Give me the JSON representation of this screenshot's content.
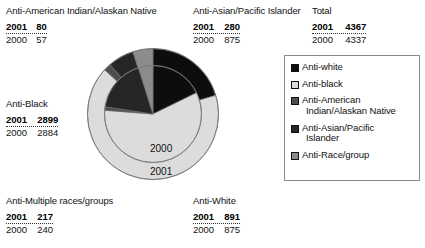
{
  "callouts": {
    "amerindian": {
      "title": "Anti-American Indian/Alaskan Native",
      "y2001_label": "2001",
      "y2001_value": "80",
      "y2000_label": "2000",
      "y2000_value": "57"
    },
    "asian": {
      "title": "Anti-Asian/Pacific Islander",
      "y2001_label": "2001",
      "y2001_value": "280",
      "y2000_label": "2000",
      "y2000_value": "875"
    },
    "total": {
      "title": "Total",
      "y2001_label": "2001",
      "y2001_value": "4367",
      "y2000_label": "2000",
      "y2000_value": "4337"
    },
    "black": {
      "title": "Anti-Black",
      "y2001_label": "2001",
      "y2001_value": "2899",
      "y2000_label": "2000",
      "y2000_value": "2884"
    },
    "multiple": {
      "title": "Anti-Multiple races/groups",
      "y2001_label": "2001",
      "y2001_value": "217",
      "y2000_label": "2000",
      "y2000_value": "240"
    },
    "white": {
      "title": "Anti-White",
      "y2001_label": "2001",
      "y2001_value": "891",
      "y2000_label": "2000",
      "y2000_value": "875"
    }
  },
  "pie": {
    "inner_ring_label": "2000",
    "outer_ring_label": "2001"
  },
  "legend": {
    "items": [
      {
        "label": "Anti-white",
        "label_line2": "",
        "color": "#0d0d0d"
      },
      {
        "label": "Anti-black",
        "label_line2": "",
        "color": "#dcdcdc"
      },
      {
        "label": "Anti-American",
        "label_line2": "Indian/Alaskan Native",
        "color": "#4d4d4d"
      },
      {
        "label": "Anti-Asian/Pacific",
        "label_line2": "Islander",
        "color": "#262626"
      },
      {
        "label": "Anti-Race/group",
        "label_line2": "",
        "color": "#8c8c8c"
      }
    ]
  },
  "chart_data": {
    "type": "pie",
    "title": "",
    "legend_position": "right",
    "categories": [
      "Anti-white",
      "Anti-black",
      "Anti-American Indian/Alaskan Native",
      "Anti-Asian/Pacific Islander",
      "Anti-Race/group"
    ],
    "colors": [
      "#0d0d0d",
      "#dcdcdc",
      "#4d4d4d",
      "#262626",
      "#8c8c8c"
    ],
    "series": [
      {
        "name": "2001",
        "ring": "outer",
        "total": 4367,
        "values": [
          891,
          2899,
          80,
          280,
          217
        ]
      },
      {
        "name": "2000",
        "ring": "inner",
        "total": 4337,
        "values": [
          875,
          2884,
          57,
          875,
          240
        ]
      }
    ]
  }
}
